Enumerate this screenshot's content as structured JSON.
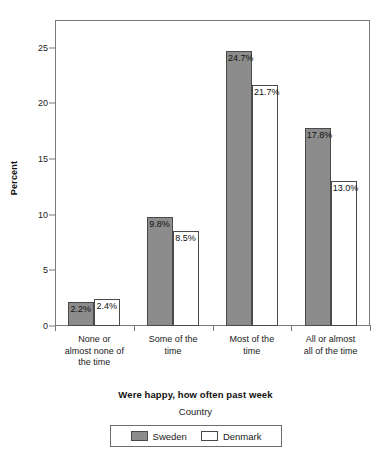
{
  "chart_data": {
    "type": "bar",
    "title": "",
    "xlabel": "Were happy, how often past week",
    "ylabel": "Percent",
    "ylim": [
      0,
      27.5
    ],
    "yticks": [
      0,
      5,
      10,
      15,
      20,
      25
    ],
    "grid": false,
    "legend_title": "Country",
    "legend_position": "bottom",
    "categories": [
      "None or almost none of the time",
      "Some of the time",
      "Most of the time",
      "All or almost all of the time"
    ],
    "category_lines": [
      [
        "None or",
        "almost none of",
        "the time"
      ],
      [
        "Some of the",
        "time"
      ],
      [
        "Most of the",
        "time"
      ],
      [
        "All or almost",
        "all of the time"
      ]
    ],
    "series": [
      {
        "name": "Sweden",
        "color": "#8c8c8c",
        "values": [
          2.2,
          9.8,
          24.7,
          17.8
        ],
        "labels": [
          "2.2%",
          "9.8%",
          "24.7%",
          "17.8%"
        ]
      },
      {
        "name": "Denmark",
        "color": "#ffffff",
        "values": [
          2.4,
          8.5,
          21.7,
          13.0
        ],
        "labels": [
          "2.4%",
          "8.5%",
          "21.7%",
          "13.0%"
        ]
      }
    ]
  },
  "axis": {
    "y_title": "Percent",
    "y_tick_labels": [
      "0",
      "5",
      "10",
      "15",
      "20",
      "25"
    ],
    "x_title": "Were happy, how often past week"
  },
  "legend": {
    "title": "Country",
    "entries": [
      {
        "label": "Sweden",
        "swatch": "filled-gray-swatch"
      },
      {
        "label": "Denmark",
        "swatch": "outlined-white-swatch"
      }
    ]
  },
  "colors": {
    "sweden_fill": "#8c8c8c",
    "denmark_fill": "#ffffff",
    "bar_border": "#4a4a4a",
    "axis": "#7a7a7a",
    "text": "#1a1a1a"
  }
}
